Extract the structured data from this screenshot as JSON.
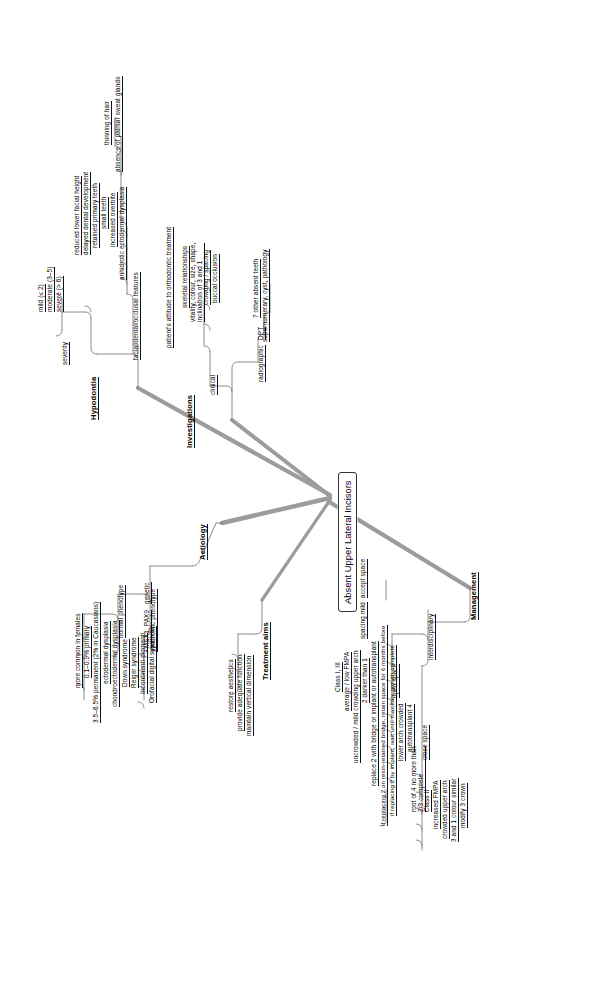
{
  "diagram": {
    "type": "mind-map",
    "orientation": "rotated-90-ccw",
    "root": "Absent Upper Lateral Incisors",
    "colors": {
      "text": "#000000",
      "branch_line": "#9a9a9a",
      "node_border": "#333333",
      "background": "#ffffff"
    }
  },
  "root": {
    "label": "Absent Upper Lateral Incisors"
  },
  "branches": {
    "hypodontia": {
      "label": "Hypodontia",
      "severity": {
        "label": "severity",
        "items": [
          "mild (≤ 2)",
          "moderate (3–5)",
          "severe (> 6)"
        ]
      },
      "features": {
        "label": "facial/dental/occlusal features",
        "items": [
          "reduced lower facial height",
          "delayed dental development",
          "retained primary teeth",
          "small teeth",
          "increased overbite",
          "anhidrotic ectodermal dysplasia"
        ],
        "anhidrotic_children": [
          "thinning of hair",
          "absence of palmar sweat glands"
        ]
      }
    },
    "investigations": {
      "label": "Investigations",
      "clinical": {
        "label": "clinical",
        "items": [
          "patient's attitude to orthodontic treatment",
          "skeletal relationships",
          "vitality, colour, size, shape,",
          "inclination of 3 and 1",
          "crowding / spacing",
          "buccal occlusion"
        ]
      },
      "radiographic": {
        "label": "radiographic",
        "dpt_label": "DPT",
        "items": [
          "? other absent teeth",
          "supernumerary, cyst, pathology"
        ]
      }
    },
    "aetiology": {
      "label": "Aetiology",
      "genetic": {
        "label": "genetic",
        "items": [
          "MSX1, PAX9"
        ]
      },
      "normal_phenotype": {
        "label": "normal phenotype",
        "items": [
          "more common in females",
          "0.1–0.9% primary",
          "3.5–6.5% permanent (2% in Caucasians)",
          "ectodermal dysplasia",
          "chondroectodermal dysplasia"
        ]
      },
      "syndromic_phenotype": {
        "label": "syndromic phenotype",
        "items": [
          "Down syndrome",
          "Reiger syndrome",
          "Incontinenti pigmenti",
          "Orofacial digital syndrome"
        ]
      }
    },
    "treatment_aims": {
      "label": "Treatment aims",
      "items": [
        "restore aesthetics",
        "provide adequate function",
        "maintain vertical dimension"
      ]
    },
    "management": {
      "label": "Management",
      "interdisciplinary": {
        "label": "interdisciplinary"
      },
      "spacing_mild": {
        "label": "spacing mild",
        "child": "accept space"
      },
      "open_space": {
        "label": "open space",
        "items": [
          "Class I, III",
          "average / low FMPA",
          "uncrowded / mild crowding upper arch",
          "2 darker than 1",
          "replace 2 with bridge or implant or autotransplant",
          "if replacing 2 on resin-retained bridge, retain space for 6 months before",
          "if replacing 2 by implant, wait until maxillary growth complete",
          "lower arch crowded",
          "autotransplant 4"
        ],
        "autotransplant_child": [
          "root of 4 no more than",
          "2/3 complete"
        ]
      },
      "close_space": {
        "label": "close space",
        "items": [
          "Class II",
          "increased FMPA",
          "crowded upper arch",
          "3 and 1 colour similar",
          "modify 3 crown"
        ]
      }
    }
  }
}
